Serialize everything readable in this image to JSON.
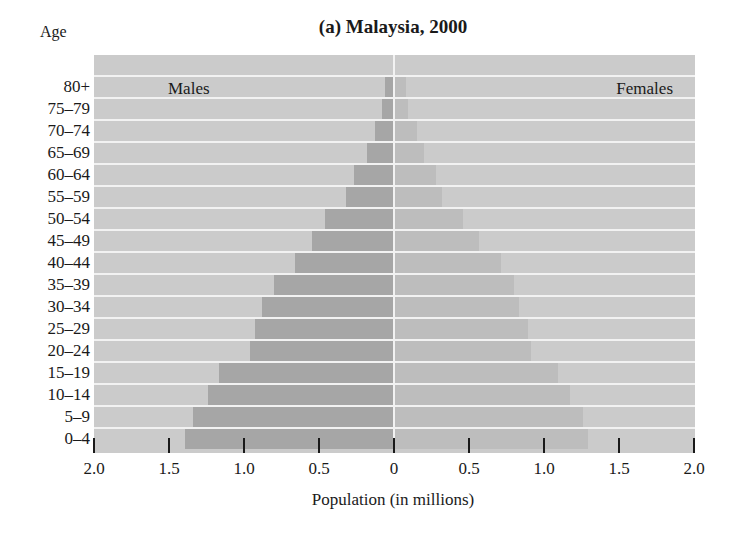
{
  "chart_data": {
    "type": "bar",
    "subtype": "population-pyramid",
    "title": "(a) Malaysia, 2000",
    "xlabel": "Population (in millions)",
    "ylabel": "Age",
    "xlim": [
      -2.0,
      2.0
    ],
    "x_ticks": [
      "2.0",
      "1.5",
      "1.0",
      "0.5",
      "0",
      "0.5",
      "1.0",
      "1.5",
      "2.0"
    ],
    "categories": [
      "80+",
      "75–79",
      "70–74",
      "65–69",
      "60–64",
      "55–59",
      "50–54",
      "45–49",
      "40–44",
      "35–39",
      "30–34",
      "25–29",
      "20–24",
      "15–19",
      "10–14",
      "5–9",
      "0–4"
    ],
    "series": [
      {
        "name": "Males",
        "side": "left",
        "color": "#a6a6a6",
        "values": [
          0.05,
          0.07,
          0.12,
          0.17,
          0.26,
          0.31,
          0.45,
          0.54,
          0.65,
          0.79,
          0.87,
          0.92,
          0.95,
          1.16,
          1.23,
          1.33,
          1.39
        ]
      },
      {
        "name": "Females",
        "side": "right",
        "color": "#bdbdbd",
        "values": [
          0.08,
          0.09,
          0.15,
          0.2,
          0.28,
          0.32,
          0.46,
          0.57,
          0.71,
          0.8,
          0.83,
          0.89,
          0.91,
          1.09,
          1.17,
          1.26,
          1.29
        ]
      }
    ],
    "grid": false,
    "legend": "inline labels: Males (top-left), Females (top-right)",
    "background_color": "#cbcbcb"
  },
  "labels": {
    "title": "(a) Malaysia, 2000",
    "age": "Age",
    "males": "Males",
    "females": "Females",
    "xlabel": "Population (in millions)"
  }
}
